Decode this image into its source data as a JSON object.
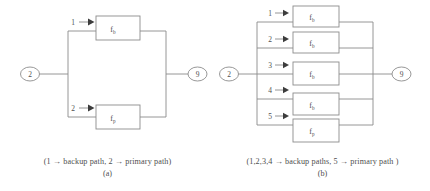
{
  "figure_a": {
    "name": "parallel-two-path-diagram",
    "source_node": "2",
    "sink_node": "9",
    "branches": [
      {
        "path_number": "1",
        "block_base": "f",
        "block_sub": "b",
        "role": "backup path"
      },
      {
        "path_number": "2",
        "block_base": "f",
        "block_sub": "p",
        "role": "primary path"
      }
    ],
    "caption": "(1 → backup path, 2 → primary path)",
    "label": "(a)"
  },
  "figure_b": {
    "name": "parallel-five-path-diagram",
    "source_node": "2",
    "sink_node": "9",
    "branches": [
      {
        "path_number": "1",
        "block_base": "f",
        "block_sub": "b",
        "role": "backup path"
      },
      {
        "path_number": "2",
        "block_base": "f",
        "block_sub": "b",
        "role": "backup path"
      },
      {
        "path_number": "3",
        "block_base": "f",
        "block_sub": "b",
        "role": "backup path"
      },
      {
        "path_number": "4",
        "block_base": "f",
        "block_sub": "b",
        "role": "backup path"
      },
      {
        "path_number": "5",
        "block_base": "f",
        "block_sub": "p",
        "role": "primary path"
      }
    ],
    "caption": "(1,2,3,4 → backup paths, 5 → primary path )",
    "label": "(b)"
  },
  "colors": {
    "wire": "#8a8a8a",
    "box_stroke": "#8c8c8c",
    "text": "#4f4f4f",
    "arrow": "#3c3c3c",
    "background": "#ffffff"
  }
}
